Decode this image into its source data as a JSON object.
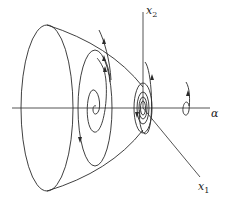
{
  "diagram": {
    "type": "phase-portrait-3d",
    "axes": {
      "alpha": {
        "label": "α"
      },
      "x1": {
        "label_main": "x",
        "label_sub": "1"
      },
      "x2": {
        "label_main": "x",
        "label_sub": "2"
      }
    },
    "colors": {
      "stroke": "#2a2a2a",
      "background": "#ffffff"
    }
  }
}
